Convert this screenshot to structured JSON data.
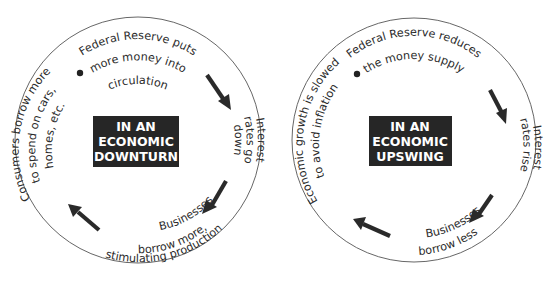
{
  "diagram": {
    "type": "cycle-pair",
    "colors": {
      "ring_stroke": "#555555",
      "box_fill": "#262626",
      "box_text": "#ffffff",
      "text": "#2b2b2b",
      "arrow": "#2a2a2a"
    },
    "cycles": [
      {
        "id": "downturn",
        "center_label": [
          "IN AN",
          "ECONOMIC",
          "DOWNTURN"
        ],
        "steps": [
          {
            "lines": [
              "Federal Reserve puts",
              "more money into",
              "circulation"
            ]
          },
          {
            "lines": [
              "Interest",
              "rates go",
              "down"
            ]
          },
          {
            "lines": [
              "Businesses",
              "borrow more,",
              "stimulating production"
            ]
          },
          {
            "lines": [
              "Consumers borrow more",
              "to spend on cars,",
              "homes, etc."
            ]
          }
        ]
      },
      {
        "id": "upswing",
        "center_label": [
          "IN AN",
          "ECONOMIC",
          "UPSWING"
        ],
        "steps": [
          {
            "lines": [
              "Federal Reserve reduces",
              "the money supply"
            ]
          },
          {
            "lines": [
              "Interest",
              "rates rise"
            ]
          },
          {
            "lines": [
              "Businesses",
              "borrow less"
            ]
          },
          {
            "lines": [
              "Economic growth is slowed",
              "to avoid inflation"
            ]
          }
        ]
      }
    ]
  }
}
